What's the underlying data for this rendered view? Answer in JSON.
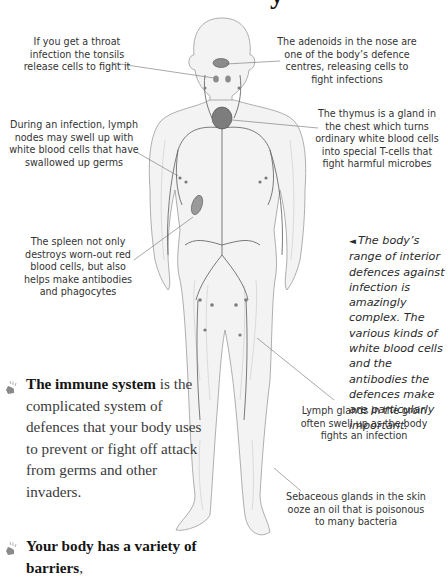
{
  "page": {
    "title_fragment": "y"
  },
  "callouts": [
    {
      "id": "tonsils",
      "text": "If you get a throat infection the tonsils release cells to fight it"
    },
    {
      "id": "adenoids",
      "text": "The adenoids in the nose are one of the body’s defence centres, releasing cells to fight infections"
    },
    {
      "id": "lymph-nodes",
      "text": "During an infection, lymph nodes may swell up with white blood cells that have swallowed up germs"
    },
    {
      "id": "thymus",
      "text": "The thymus is a gland in the chest which turns ordinary white blood cells into special T-cells that fight harmful microbes"
    },
    {
      "id": "spleen",
      "text": "The spleen not only destroys worn-out red blood cells, but also helps make antibodies and phagocytes"
    },
    {
      "id": "groin",
      "text": "Lymph glands in the groin often swell up as the body fights an infection"
    },
    {
      "id": "sebaceous",
      "text": "Sebaceous glands in the skin ooze an oil that is poisonous to many bacteria"
    }
  ],
  "caption": {
    "arrow": "◄",
    "text": "The body’s range of interior defences against infection is amazingly complex. The various kinds of white blood cells and the antibodies the defences make are particularly important."
  },
  "facts": [
    {
      "icon": "hand-pointer-icon",
      "bold": "The immune system",
      "text": " is the complicated system of defences that your body uses to prevent or fight off attack from germs and other invaders."
    },
    {
      "icon": "hand-pointer-icon",
      "bold": "Your body has a variety of barriers",
      "text": ","
    }
  ]
}
